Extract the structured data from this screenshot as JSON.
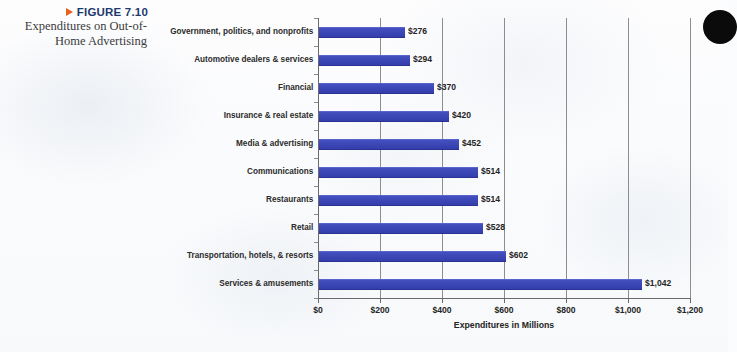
{
  "figure": {
    "number": "FIGURE 7.10",
    "caption_line_1": "Expenditures on Out-of-",
    "caption_line_2": "Home Advertising",
    "marker_icon": "triangle-right-icon",
    "number_color": "#1d3a6e",
    "marker_color": "#e8601c"
  },
  "chart_data": {
    "type": "bar",
    "orientation": "horizontal",
    "xlabel": "Expenditures in Millions",
    "ylabel": "",
    "xlim": [
      0,
      1200
    ],
    "xticks": [
      0,
      200,
      400,
      600,
      800,
      1000,
      1200
    ],
    "xtick_labels": [
      "$0",
      "$200",
      "$400",
      "$600",
      "$800",
      "$1,000",
      "$1,200"
    ],
    "grid": "vertical",
    "legend": "none",
    "bar_color": "#3b45b4",
    "categories": [
      "Government, politics, and nonprofits",
      "Automotive dealers & services",
      "Financial",
      "Insurance & real estate",
      "Media & advertising",
      "Communications",
      "Restaurants",
      "Retail",
      "Transportation, hotels, & resorts",
      "Services & amusements"
    ],
    "values": [
      276,
      294,
      370,
      420,
      452,
      514,
      514,
      528,
      602,
      1042
    ],
    "data_labels": [
      "$276",
      "$294",
      "$370",
      "$420",
      "$452",
      "$514",
      "$514",
      "$528",
      "$602",
      "$1,042"
    ]
  },
  "decoration": {
    "corner_dot": "black-circle-icon"
  }
}
